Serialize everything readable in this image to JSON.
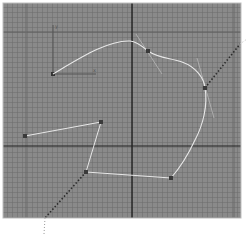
{
  "viewport": {
    "name": "Top",
    "background": "#8a8a8a",
    "grid_minor_color": "#6e6e6e",
    "grid_major_color": "#5a5a5a",
    "axis_color": "#111111",
    "spline_color": "#e6e6e6",
    "vertex_color": "#3a3a3a",
    "axis_lines": {
      "vertical_x": 132,
      "horizontal_y": 146
    },
    "major_grid": {
      "x": [
        26,
        234
      ],
      "y": [
        32
      ]
    }
  },
  "gizmo": {
    "origin": [
      53,
      74
    ],
    "y_axis_end": [
      53,
      25
    ],
    "x_axis_end": [
      96,
      74
    ],
    "x_label": "x",
    "y_label": "y"
  },
  "curve_spline": {
    "path": "M53,74 C80,58 108,40 130,41 C138,42 143,47 148,51 C158,58 170,58 182,62 C196,67 204,78 205,88 C208,105 203,125 195,140 C188,155 178,170 171,178",
    "vertices": [
      [
        148,
        51
      ],
      [
        205,
        88
      ],
      [
        171,
        178
      ]
    ]
  },
  "tangent_handles": [
    {
      "from": [
        136,
        34
      ],
      "to": [
        162,
        74
      ]
    },
    {
      "from": [
        197,
        58
      ],
      "to": [
        214,
        118
      ]
    }
  ],
  "polyline": {
    "points": [
      [
        25,
        136
      ],
      [
        101,
        122
      ],
      [
        86,
        172
      ],
      [
        171,
        178
      ]
    ]
  },
  "dotted_paths": [
    {
      "points": [
        [
          205,
          88
        ],
        [
          240,
          44
        ]
      ]
    },
    {
      "points": [
        [
          86,
          172
        ],
        [
          45,
          221
        ],
        [
          44,
          234
        ]
      ]
    }
  ]
}
